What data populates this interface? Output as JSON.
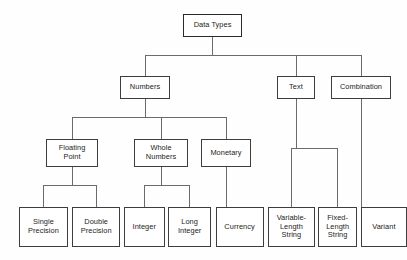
{
  "diagram": {
    "title": "Data Types",
    "type": "hierarchy-tree",
    "orientation": "top-down",
    "style": {
      "background": "#fefefe",
      "box_fill": "#ffffff",
      "box_border": "#3d3d3d",
      "line_color": "#6b6b6b",
      "text_color": "#232323"
    },
    "nodes": [
      {
        "id": "data-types",
        "label": "Data Types",
        "level": 0,
        "x": 183,
        "y": 14,
        "w": 59,
        "h": 23
      },
      {
        "id": "numbers",
        "label": "Numbers",
        "level": 1,
        "x": 120,
        "y": 76,
        "w": 50,
        "h": 23
      },
      {
        "id": "text",
        "label": "Text",
        "level": 1,
        "x": 277,
        "y": 76,
        "w": 38,
        "h": 23
      },
      {
        "id": "combination",
        "label": "Combination",
        "level": 1,
        "x": 331,
        "y": 76,
        "w": 60,
        "h": 23
      },
      {
        "id": "floating-point",
        "label": "Floating\nPoint",
        "level": 2,
        "x": 46,
        "y": 139,
        "w": 52,
        "h": 28
      },
      {
        "id": "whole-numbers",
        "label": "Whole\nNumbers",
        "level": 2,
        "x": 134,
        "y": 139,
        "w": 54,
        "h": 28
      },
      {
        "id": "monetary",
        "label": "Monetary",
        "level": 2,
        "x": 201,
        "y": 139,
        "w": 50,
        "h": 28
      },
      {
        "id": "single-precision",
        "label": "Single\nPrecision",
        "level": 3,
        "x": 21,
        "y": 207,
        "w": 52,
        "h": 40
      },
      {
        "id": "double-precision",
        "label": "Double\nPrecision",
        "level": 3,
        "x": 78,
        "y": 207,
        "w": 52,
        "h": 40
      },
      {
        "id": "integer",
        "label": "Integer",
        "level": 3,
        "x": 134,
        "y": 207,
        "w": 44,
        "h": 40
      },
      {
        "id": "long-integer",
        "label": "Long\nInteger",
        "level": 3,
        "x": 182,
        "y": 207,
        "w": 46,
        "h": 40
      },
      {
        "id": "currency",
        "label": "Currency",
        "level": 3,
        "x": 233,
        "y": 207,
        "w": 52,
        "h": 40
      },
      {
        "id": "variable-length-string",
        "label": "Variable-\nLength\nString",
        "level": 3,
        "x": 290,
        "y": 207,
        "w": 50,
        "h": 40
      },
      {
        "id": "fixed-length-string",
        "label": "Fixed-\nLength\nString",
        "level": 3,
        "x": 344,
        "y": 207,
        "w": 42,
        "h": 40
      },
      {
        "id": "variant",
        "label": "Variant",
        "level": 3,
        "x": 390,
        "y": 207,
        "w": 50,
        "h": 40
      }
    ],
    "edges": [
      {
        "from": "data-types",
        "to": "numbers"
      },
      {
        "from": "data-types",
        "to": "text"
      },
      {
        "from": "data-types",
        "to": "combination"
      },
      {
        "from": "numbers",
        "to": "floating-point"
      },
      {
        "from": "numbers",
        "to": "whole-numbers"
      },
      {
        "from": "numbers",
        "to": "monetary"
      },
      {
        "from": "floating-point",
        "to": "single-precision"
      },
      {
        "from": "floating-point",
        "to": "double-precision"
      },
      {
        "from": "whole-numbers",
        "to": "integer"
      },
      {
        "from": "whole-numbers",
        "to": "long-integer"
      },
      {
        "from": "monetary",
        "to": "currency"
      },
      {
        "from": "text",
        "to": "variable-length-string"
      },
      {
        "from": "text",
        "to": "fixed-length-string"
      },
      {
        "from": "combination",
        "to": "variant"
      }
    ]
  }
}
